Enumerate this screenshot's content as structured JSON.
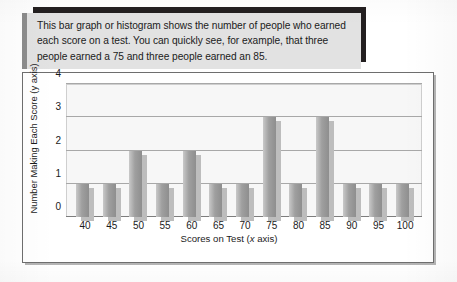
{
  "caption": {
    "text": "This bar graph or histogram shows the number of people who earned each score on a test. You can quickly see, for example, that three people earned a 75 and three people earned an 85."
  },
  "chart_data": {
    "type": "bar",
    "title": "",
    "xlabel": "Scores on Test (x axis)",
    "ylabel": "Number Making Each Score (y axis)",
    "categories": [
      "40",
      "45",
      "50",
      "55",
      "60",
      "65",
      "70",
      "75",
      "80",
      "85",
      "90",
      "95",
      "100"
    ],
    "values": [
      1,
      1,
      2,
      1,
      2,
      1,
      1,
      3,
      1,
      3,
      1,
      1,
      1
    ],
    "ylim": [
      0,
      4
    ],
    "y_ticks": [
      "0",
      "1",
      "2",
      "3",
      "4"
    ],
    "grid": true,
    "legend": "none",
    "bar_color": "#9f9f9f",
    "shadow_color": "#bdbdbd",
    "plot_background": "#f7f7f7",
    "gridline_color": "#a8a8a8"
  },
  "colors": {
    "caption_background": "#e2e2e2",
    "caption_rule": "#231f20",
    "frame_border": "#6e6e6e",
    "page_background": "#ffffff",
    "text": "#1b1b1b"
  }
}
